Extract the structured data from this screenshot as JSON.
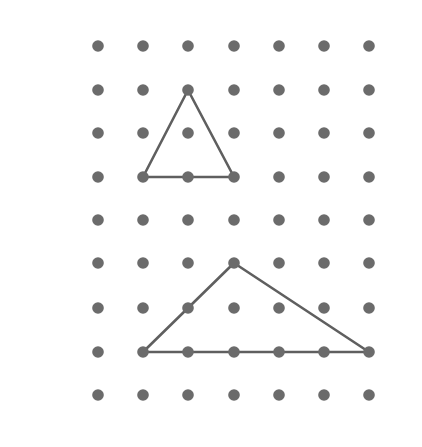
{
  "figure": {
    "name": "geoboard-dot-grid-triangles",
    "background_color": "#ffffff",
    "width": 422,
    "height": 447
  },
  "grid": {
    "name": "dot-grid",
    "columns": 7,
    "rows": 9,
    "dot_color": "#6b6b6b",
    "dot_radius": 5.8,
    "column_x": [
      98,
      143,
      188,
      234,
      279,
      324,
      369
    ],
    "row_y": [
      46,
      90,
      133,
      177,
      220,
      263,
      308,
      352,
      395
    ],
    "column_spacing": 45.2,
    "row_spacing": 43.6
  },
  "shapes": [
    {
      "name": "upper-triangle",
      "label": "triangle-1",
      "stroke_color": "#5f5f5f",
      "stroke_width": 2.6,
      "fill": "none",
      "vertices_grid": [
        {
          "col": 3,
          "row": 2
        },
        {
          "col": 2,
          "row": 4
        },
        {
          "col": 4,
          "row": 4
        }
      ],
      "vertices_px": [
        {
          "x": 188,
          "y": 90
        },
        {
          "x": 143,
          "y": 177
        },
        {
          "x": 234,
          "y": 177
        }
      ],
      "base_interior_dots_px": [
        {
          "x": 188,
          "y": 177
        }
      ]
    },
    {
      "name": "lower-triangle",
      "label": "triangle-2",
      "stroke_color": "#5f5f5f",
      "stroke_width": 2.6,
      "fill": "none",
      "vertices_grid": [
        {
          "col": 4,
          "row": 6
        },
        {
          "col": 2,
          "row": 8
        },
        {
          "col": 7,
          "row": 8
        }
      ],
      "vertices_px": [
        {
          "x": 234,
          "y": 263
        },
        {
          "x": 143,
          "y": 352
        },
        {
          "x": 369,
          "y": 352
        }
      ],
      "base_interior_dots_px": [
        {
          "x": 188,
          "y": 352
        },
        {
          "x": 234,
          "y": 352
        },
        {
          "x": 279,
          "y": 352
        },
        {
          "x": 324,
          "y": 352
        }
      ],
      "edge_interior_dots_px": [
        {
          "x": 188,
          "y": 308
        }
      ]
    }
  ]
}
